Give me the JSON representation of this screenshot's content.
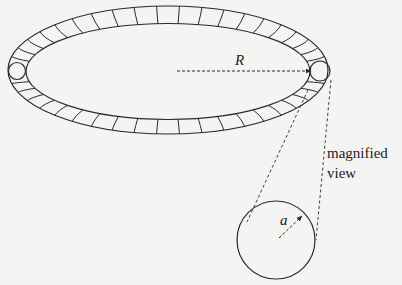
{
  "diagram": {
    "type": "torus-cross-section",
    "labels": {
      "major_radius": "R",
      "minor_radius": "a",
      "annotation_line1": "magnified",
      "annotation_line2": "view"
    },
    "colors": {
      "stroke": "#2a2a2a",
      "background": "#f4f4f2"
    },
    "torus": {
      "center": [
        168,
        71
      ],
      "outer": {
        "rx": 160,
        "ry": 64
      },
      "inner": {
        "rx": 142,
        "ry": 48
      },
      "segment_count_visible_top": 22,
      "segment_count_visible_bottom": 22
    },
    "magnified_circle": {
      "center": [
        276,
        240
      ],
      "radius": 39
    }
  }
}
